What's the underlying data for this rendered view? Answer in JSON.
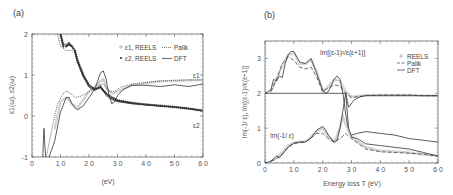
{
  "chart_data": [
    {
      "panel": "(a)",
      "type": "line",
      "title": "",
      "xlabel": "(eV)",
      "ylabel": "ε1(ω), ε2(ω)",
      "xlim": [
        0,
        60
      ],
      "ylim": [
        -1,
        2
      ],
      "xticks": [
        "0",
        "10",
        "20",
        "30",
        "40",
        "50",
        "60"
      ],
      "yticks": [
        "-1",
        "0",
        "1",
        "2"
      ],
      "grid": false,
      "legend_position": "upper right",
      "legend": [
        "ε1, REELS",
        "Palik",
        "ε2, REELS",
        "DFT"
      ],
      "annotations": [
        "ε1",
        "ε2"
      ],
      "series": [
        {
          "name": "ε1 REELS",
          "style": "open-markers",
          "x": [
            8,
            10,
            12,
            14,
            16,
            18,
            20,
            22,
            24,
            25,
            26,
            28,
            30,
            35,
            40,
            45,
            50,
            55,
            60
          ],
          "y": [
            -0.3,
            0.35,
            0.45,
            0.3,
            0.2,
            0.4,
            0.6,
            0.7,
            0.85,
            0.9,
            0.7,
            0.55,
            0.6,
            0.75,
            0.8,
            0.85,
            0.85,
            0.87,
            0.87
          ]
        },
        {
          "name": "ε1 Palik",
          "style": "dotted",
          "x": [
            5,
            7,
            9,
            11,
            12,
            13,
            15,
            17,
            19,
            21,
            23,
            25,
            27,
            29,
            31,
            35,
            40,
            45,
            50,
            55,
            60
          ],
          "y": [
            -1,
            -0.3,
            0.3,
            0.55,
            0.6,
            0.58,
            0.45,
            0.48,
            0.55,
            0.62,
            0.75,
            0.78,
            0.6,
            0.6,
            0.7,
            0.78,
            0.82,
            0.85,
            0.87,
            0.88,
            0.88
          ]
        },
        {
          "name": "ε1 DFT",
          "style": "solid",
          "x": [
            6,
            8,
            10,
            12,
            13,
            14,
            15,
            16,
            18,
            20,
            22,
            23,
            24,
            25,
            26,
            27,
            28,
            29,
            30,
            32,
            35,
            40,
            45,
            50,
            55,
            60
          ],
          "y": [
            -1,
            -0.6,
            0.1,
            0.45,
            0.45,
            0.3,
            0.2,
            0.15,
            0.25,
            0.45,
            0.65,
            0.85,
            1.05,
            1.1,
            0.9,
            0.5,
            0.3,
            0.35,
            0.5,
            0.65,
            0.75,
            0.75,
            0.72,
            0.76,
            0.72,
            0.78
          ]
        },
        {
          "name": "ε2 REELS",
          "style": "filled-markers",
          "x": [
            10,
            11,
            12,
            13,
            14,
            15,
            16,
            18,
            20,
            22,
            24,
            26,
            28,
            30,
            35,
            40,
            45,
            50,
            55,
            60
          ],
          "y": [
            2.0,
            1.7,
            1.7,
            1.75,
            1.7,
            1.6,
            1.35,
            1.0,
            0.75,
            0.65,
            0.7,
            0.55,
            0.45,
            0.38,
            0.32,
            0.28,
            0.25,
            0.22,
            0.18,
            0.13
          ]
        },
        {
          "name": "ε2 Palik",
          "style": "dotted",
          "x": [
            9,
            10,
            12,
            14,
            15,
            16,
            18,
            20,
            22,
            24,
            26,
            28,
            30,
            35,
            40,
            45,
            50,
            55,
            60
          ],
          "y": [
            2.0,
            1.7,
            1.6,
            1.6,
            1.55,
            1.3,
            0.95,
            0.75,
            0.65,
            0.72,
            0.55,
            0.42,
            0.36,
            0.3,
            0.27,
            0.25,
            0.22,
            0.18,
            0.14
          ]
        },
        {
          "name": "ε2 DFT",
          "style": "solid",
          "x": [
            10,
            11,
            12,
            13,
            14,
            15,
            16,
            18,
            20,
            22,
            24,
            26,
            28,
            30,
            35,
            40,
            45,
            50,
            55,
            60
          ],
          "y": [
            2.0,
            1.75,
            1.75,
            1.8,
            1.7,
            1.6,
            1.3,
            0.95,
            0.7,
            0.62,
            0.75,
            0.5,
            0.4,
            0.35,
            0.3,
            0.27,
            0.24,
            0.22,
            0.18,
            0.12
          ]
        },
        {
          "name": "low-energy spike",
          "style": "solid",
          "x": [
            3.8,
            4.0,
            4.2,
            4.5,
            4.8
          ],
          "y": [
            -1,
            -0.6,
            -0.3,
            -0.7,
            -1
          ]
        }
      ]
    },
    {
      "panel": "(b)",
      "type": "line",
      "title": "",
      "xlabel": "Energy loss T (eV)",
      "ylabel": "Im(-1/ ε), Im[(ε-1)²/ε(ε+1)]",
      "xlim": [
        0,
        60
      ],
      "ylim": [
        0,
        3.5
      ],
      "xticks": [
        "0",
        "10",
        "20",
        "30",
        "40",
        "50",
        "60"
      ],
      "yticks": [
        "0",
        "1",
        "2",
        "3"
      ],
      "grid": false,
      "legend_position": "upper right",
      "legend": [
        "REELS",
        "Palik",
        "DFT"
      ],
      "annotations": [
        "Im[(ε-1)²/ε(ε+1)]",
        "Im(-1/ ε)"
      ],
      "offset_note": "upper curves offset by +2",
      "series": [
        {
          "name": "Surface REELS",
          "style": "open-markers",
          "x": [
            2,
            4,
            6,
            8,
            10,
            12,
            14,
            16,
            18,
            20,
            22,
            24,
            26,
            28,
            30,
            35,
            40,
            45,
            50,
            55,
            60
          ],
          "y": [
            2.05,
            2.4,
            2.8,
            3.1,
            3.15,
            2.85,
            2.85,
            2.95,
            2.6,
            2.05,
            2.2,
            2.4,
            2.35,
            2.05,
            1.9,
            1.95,
            1.95,
            1.95,
            1.95,
            1.93,
            1.93
          ]
        },
        {
          "name": "Surface Palik",
          "style": "dashed",
          "x": [
            2,
            4,
            6,
            8,
            10,
            12,
            14,
            16,
            18,
            20,
            22,
            24,
            26,
            28,
            30,
            35,
            40,
            45,
            50,
            55,
            60
          ],
          "y": [
            2.05,
            2.4,
            2.85,
            3.05,
            2.95,
            2.75,
            2.7,
            2.75,
            2.45,
            2.05,
            2.15,
            2.25,
            2.2,
            2.0,
            1.88,
            1.93,
            1.95,
            1.95,
            1.95,
            1.93,
            1.93
          ]
        },
        {
          "name": "Surface DFT",
          "style": "solid",
          "x": [
            0,
            2,
            3,
            4,
            5,
            6,
            7,
            8,
            9,
            10,
            12,
            14,
            16,
            18,
            20,
            21,
            22,
            24,
            25,
            26,
            27,
            28,
            29,
            30,
            32,
            35,
            40,
            45,
            50,
            55,
            60
          ],
          "y": [
            2.0,
            2.1,
            2.4,
            2.35,
            2.5,
            2.45,
            2.85,
            3.1,
            3.2,
            3.2,
            2.9,
            2.85,
            3.0,
            2.55,
            2.1,
            2.0,
            2.05,
            2.4,
            2.5,
            2.4,
            2.0,
            1.4,
            0.9,
            0.8,
            0.85,
            0.9,
            0.85,
            0.8,
            0.7,
            0.65,
            0.6
          ]
        },
        {
          "name": "Surface baseline",
          "style": "solid",
          "x": [
            0,
            28,
            29,
            31,
            33,
            35,
            60
          ],
          "y": [
            2.0,
            2.0,
            1.6,
            1.82,
            1.9,
            1.93,
            1.93
          ]
        },
        {
          "name": "Bulk REELS",
          "style": "open-markers",
          "x": [
            2,
            4,
            6,
            8,
            10,
            12,
            14,
            16,
            18,
            20,
            22,
            24,
            26,
            27,
            28,
            30,
            35,
            40,
            45,
            50,
            55,
            60
          ],
          "y": [
            0.05,
            0.15,
            0.3,
            0.5,
            0.58,
            0.6,
            0.62,
            0.75,
            0.9,
            1.0,
            0.75,
            0.6,
            1.0,
            1.35,
            1.1,
            0.75,
            0.45,
            0.35,
            0.33,
            0.3,
            0.25,
            0.2
          ]
        },
        {
          "name": "Bulk Palik",
          "style": "dashed",
          "x": [
            2,
            4,
            6,
            8,
            10,
            12,
            14,
            16,
            18,
            20,
            22,
            24,
            26,
            28,
            30,
            35,
            40,
            45,
            50,
            55,
            60
          ],
          "y": [
            0.05,
            0.12,
            0.25,
            0.45,
            0.55,
            0.6,
            0.6,
            0.72,
            0.85,
            0.85,
            0.7,
            0.6,
            0.7,
            0.85,
            0.7,
            0.4,
            0.32,
            0.3,
            0.28,
            0.25,
            0.2
          ]
        },
        {
          "name": "Bulk DFT",
          "style": "solid",
          "x": [
            0,
            2,
            4,
            5,
            6,
            7,
            8,
            10,
            12,
            14,
            16,
            18,
            20,
            21,
            22,
            24,
            25,
            26,
            27,
            28,
            29,
            30,
            32,
            35,
            40,
            45,
            50,
            55,
            60
          ],
          "y": [
            0.0,
            0.05,
            0.2,
            0.15,
            0.25,
            0.35,
            0.45,
            0.57,
            0.6,
            0.6,
            0.72,
            0.95,
            1.05,
            0.95,
            0.8,
            0.6,
            0.65,
            1.0,
            1.5,
            2.0,
            1.0,
            0.75,
            0.7,
            0.55,
            0.5,
            0.45,
            0.4,
            0.3,
            0.2
          ]
        }
      ]
    }
  ]
}
